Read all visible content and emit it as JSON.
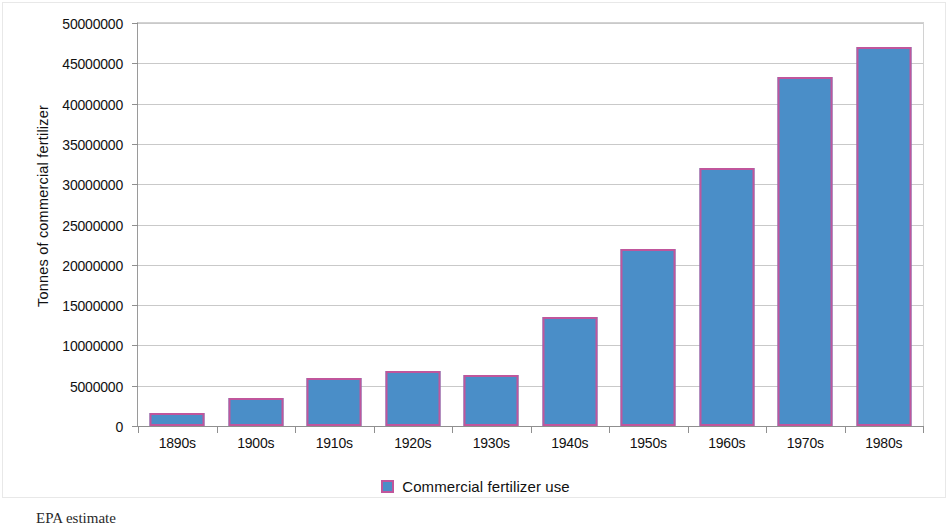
{
  "chart_data": {
    "type": "bar",
    "title": "",
    "xlabel": "",
    "ylabel": "Tonnes of commercial fertilizer",
    "categories": [
      "1890s",
      "1900s",
      "1910s",
      "1920s",
      "1930s",
      "1940s",
      "1950s",
      "1960s",
      "1970s",
      "1980s"
    ],
    "values": [
      1600000,
      3500000,
      6000000,
      6800000,
      6300000,
      13500000,
      22000000,
      32000000,
      43300000,
      47000000
    ],
    "series": [
      {
        "name": "Commercial fertilizer use",
        "values": [
          1600000,
          3500000,
          6000000,
          6800000,
          6300000,
          13500000,
          22000000,
          32000000,
          43300000,
          47000000
        ],
        "color": "#4a8ec8",
        "border_color": "#c0569c"
      }
    ],
    "ylim": [
      0,
      50000000
    ],
    "ytick_step": 5000000,
    "ytick_labels": [
      "50000000",
      "45000000",
      "40000000",
      "35000000",
      "30000000",
      "25000000",
      "20000000",
      "15000000",
      "10000000",
      "5000000",
      "0"
    ],
    "ytick_values": [
      50000000,
      45000000,
      40000000,
      35000000,
      30000000,
      25000000,
      20000000,
      15000000,
      10000000,
      5000000,
      0
    ],
    "grid": true,
    "grid_axis": "y",
    "legend_position": "bottom-center"
  },
  "legend": {
    "entries": [
      {
        "label": "Commercial fertilizer use",
        "color": "#4a8ec8"
      }
    ]
  },
  "caption": {
    "text": "EPA estimate"
  },
  "colors": {
    "bar_fill": "#4a8ec8",
    "bar_border": "#c0569c",
    "gridline": "#c9c9c9",
    "axis": "#8f8f8f",
    "text": "#111111",
    "background": "#ffffff"
  }
}
